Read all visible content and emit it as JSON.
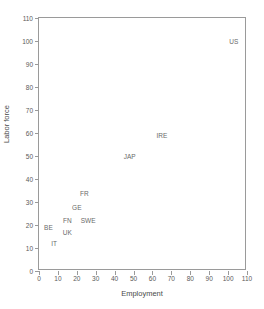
{
  "chart_data": {
    "type": "scatter",
    "title": "",
    "xlabel": "Employment",
    "ylabel": "Labor force",
    "xlim": [
      0,
      110
    ],
    "ylim": [
      0,
      110
    ],
    "xticks": [
      0,
      10,
      20,
      30,
      40,
      50,
      60,
      70,
      80,
      90,
      100,
      110
    ],
    "yticks": [
      0,
      10,
      20,
      30,
      40,
      50,
      60,
      70,
      80,
      90,
      100,
      110
    ],
    "grid": false,
    "legend": "none",
    "marker": "text-label-only",
    "points": [
      {
        "label": "BE",
        "x": 5,
        "y": 19
      },
      {
        "label": "IT",
        "x": 8,
        "y": 12
      },
      {
        "label": "UK",
        "x": 15,
        "y": 17
      },
      {
        "label": "FN",
        "x": 15,
        "y": 22
      },
      {
        "label": "GE",
        "x": 20,
        "y": 28
      },
      {
        "label": "FR",
        "x": 24,
        "y": 34
      },
      {
        "label": "SWE",
        "x": 26,
        "y": 22
      },
      {
        "label": "JAP",
        "x": 48,
        "y": 50
      },
      {
        "label": "IRE",
        "x": 65,
        "y": 59
      },
      {
        "label": "US",
        "x": 103,
        "y": 100
      }
    ]
  },
  "colors": {
    "axis": "#9a9a9a",
    "text": "#5a5a5a",
    "label": "#6a6a6a",
    "background": "#ffffff"
  }
}
